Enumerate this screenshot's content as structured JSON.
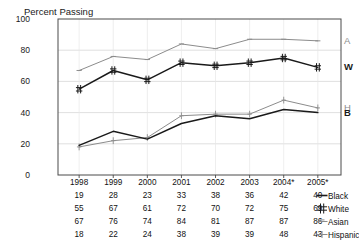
{
  "chart_data": {
    "type": "line",
    "title": "",
    "ylabel": "Percent Passing",
    "xlabel": "",
    "ylim": [
      0,
      100
    ],
    "yticks": [
      0,
      20,
      40,
      60,
      80,
      100
    ],
    "grid": true,
    "legend_position": "right-of-table",
    "categories": [
      "1998",
      "1999",
      "2000",
      "2001",
      "2002",
      "2003",
      "2004*",
      "2005*"
    ],
    "series": [
      {
        "name": "Black",
        "short": "B",
        "color": "#1a1a1a",
        "marker": "line",
        "values": [
          19,
          28,
          23,
          33,
          38,
          36,
          42,
          40
        ]
      },
      {
        "name": "White",
        "short": "W",
        "color": "#1a1a1a",
        "marker": "hash",
        "values": [
          55,
          67,
          61,
          72,
          70,
          72,
          75,
          69
        ]
      },
      {
        "name": "Asian",
        "short": "A",
        "color": "#8c8c8c",
        "marker": "dash",
        "values": [
          67,
          76,
          74,
          84,
          81,
          87,
          87,
          86
        ]
      },
      {
        "name": "Hispanic",
        "short": "H",
        "color": "#8c8c8c",
        "marker": "plus",
        "values": [
          18,
          22,
          24,
          38,
          39,
          39,
          48,
          43
        ]
      }
    ]
  },
  "axis": {
    "ytick_labels": [
      "100",
      "80",
      "60",
      "40",
      "20",
      "0"
    ]
  },
  "plot_labels": {
    "ylabel": "Percent Passing",
    "series_letters": [
      {
        "text": "A",
        "color": "#8c8c8c",
        "value": 86
      },
      {
        "text": "W",
        "color": "#1a1a1a",
        "value": 69
      },
      {
        "text": "H",
        "color": "#8c8c8c",
        "value": 43
      },
      {
        "text": "B",
        "color": "#1a1a1a",
        "value": 40
      }
    ]
  },
  "table": {
    "header": [
      "1998",
      "1999",
      "2000",
      "2001",
      "2002",
      "2003",
      "2004*",
      "2005*"
    ],
    "rows": [
      {
        "legend": "Black",
        "marker": "line",
        "color": "#1a1a1a",
        "values": [
          "19",
          "28",
          "23",
          "33",
          "38",
          "36",
          "42",
          "40"
        ]
      },
      {
        "legend": "White",
        "marker": "hash",
        "color": "#1a1a1a",
        "values": [
          "55",
          "67",
          "61",
          "72",
          "70",
          "72",
          "75",
          "69"
        ]
      },
      {
        "legend": "Asian",
        "marker": "dash",
        "color": "#8c8c8c",
        "values": [
          "67",
          "76",
          "74",
          "84",
          "81",
          "87",
          "87",
          "86"
        ]
      },
      {
        "legend": "Hispanic",
        "marker": "plus",
        "color": "#8c8c8c",
        "values": [
          "18",
          "22",
          "24",
          "38",
          "39",
          "39",
          "48",
          "43"
        ]
      }
    ]
  },
  "colors": {
    "dark_series": "#1a1a1a",
    "light_series": "#8c8c8c",
    "grid": "#d8d8d8",
    "frame": "#4a4a4a",
    "text": "#111111"
  }
}
